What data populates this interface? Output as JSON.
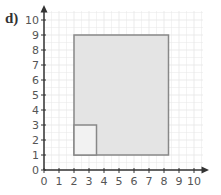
{
  "question_label": "d)",
  "axes": {
    "x_ticks": [
      "0",
      "1",
      "2",
      "3",
      "4",
      "5",
      "6",
      "7",
      "8",
      "9",
      "10"
    ],
    "y_ticks": [
      "0",
      "1",
      "2",
      "3",
      "4",
      "5",
      "6",
      "7",
      "8",
      "9",
      "10"
    ]
  },
  "shapes": {
    "large_rectangle": {
      "x1": 2,
      "y1": 1,
      "x2": 8.3,
      "y2": 9,
      "fill": "#e4e4e4",
      "stroke": "#888888"
    },
    "small_square": {
      "x1": 2,
      "y1": 1,
      "x2": 3.5,
      "y2": 3,
      "fill": "#f2f2f2",
      "stroke": "#888888"
    }
  },
  "colors": {
    "grid": "#e6e6e6",
    "axis": "#333333"
  }
}
